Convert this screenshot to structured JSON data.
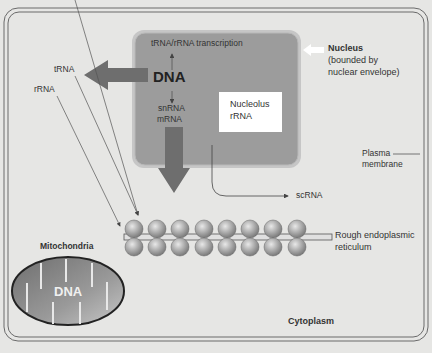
{
  "diagram": {
    "type": "eukaryotic cell RNA synthesis diagram",
    "colors": {
      "background": "#e6e6e4",
      "nucleus_fill": "#9c9c9c",
      "nucleus_border": "#c4c4c4",
      "arrow": "#6e6e6e",
      "nucleolus_fill": "#ffffff",
      "ribosome": "#a8a8a8",
      "mitochondria_fill": "#8a8a8a",
      "cell_border": "#666666"
    },
    "nucleus": {
      "label": "Nucleus",
      "description_line1": "(bounded by",
      "description_line2": "nuclear envelope)",
      "transcription_label": "tRNA/rRNA transcription",
      "dna_label": "DNA",
      "snrna_label": "snRNA",
      "mrna_label": "mRNA",
      "nucleolus_line1": "Nucleolus",
      "nucleolus_line2": "rRNA"
    },
    "cytoplasm_labels": {
      "trna": "tRNA",
      "rrna": "rRNA",
      "scrna": "scRNA",
      "plasma_membrane_line1": "Plasma",
      "plasma_membrane_line2": "membrane",
      "rer_line1": "Rough endoplasmic",
      "rer_line2": "reticulum",
      "cytoplasm": "Cytoplasm"
    },
    "mitochondria": {
      "label": "Mitochondria",
      "dna_label": "DNA"
    },
    "ribosomes": {
      "rows": 2,
      "columns": 8
    }
  }
}
